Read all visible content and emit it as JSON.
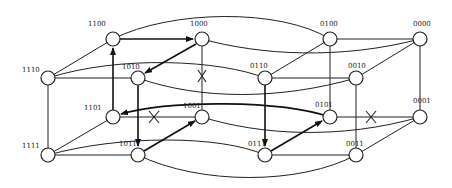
{
  "diagram": {
    "type": "4-dimensional hypercube graph",
    "nodes": [
      {
        "id": "1100",
        "label": "1100",
        "x": 113,
        "y": 39
      },
      {
        "id": "1000",
        "label": "1000",
        "x": 202,
        "y": 39
      },
      {
        "id": "0100",
        "label": "0100",
        "x": 330,
        "y": 39
      },
      {
        "id": "0000",
        "label": "0000",
        "x": 420,
        "y": 39
      },
      {
        "id": "1110",
        "label": "1110",
        "x": 48,
        "y": 78
      },
      {
        "id": "1010",
        "label": "1010",
        "x": 138,
        "y": 78
      },
      {
        "id": "0110",
        "label": "0110",
        "x": 265,
        "y": 78
      },
      {
        "id": "0010",
        "label": "0010",
        "x": 356,
        "y": 78
      },
      {
        "id": "1101",
        "label": "1101",
        "x": 113,
        "y": 117
      },
      {
        "id": "1001",
        "label": "1001",
        "x": 202,
        "y": 117
      },
      {
        "id": "0101",
        "label": "0101",
        "x": 330,
        "y": 117
      },
      {
        "id": "0001",
        "label": "0001",
        "x": 420,
        "y": 117
      },
      {
        "id": "1111",
        "label": "1111",
        "x": 48,
        "y": 155
      },
      {
        "id": "1011",
        "label": "1011",
        "x": 138,
        "y": 155
      },
      {
        "id": "0111",
        "label": "0111",
        "x": 265,
        "y": 155
      },
      {
        "id": "0011",
        "label": "0011",
        "x": 356,
        "y": 155
      }
    ],
    "directed_path": [
      "1101",
      "1100",
      "1000",
      "1010",
      "1011",
      "1001"
    ],
    "directed_path_2": [
      "0110",
      "0111",
      "0101",
      "1101"
    ],
    "faulty_links": [
      [
        "1000",
        "1001"
      ],
      [
        "1101",
        "1001"
      ],
      [
        "0101",
        "0001"
      ]
    ]
  }
}
